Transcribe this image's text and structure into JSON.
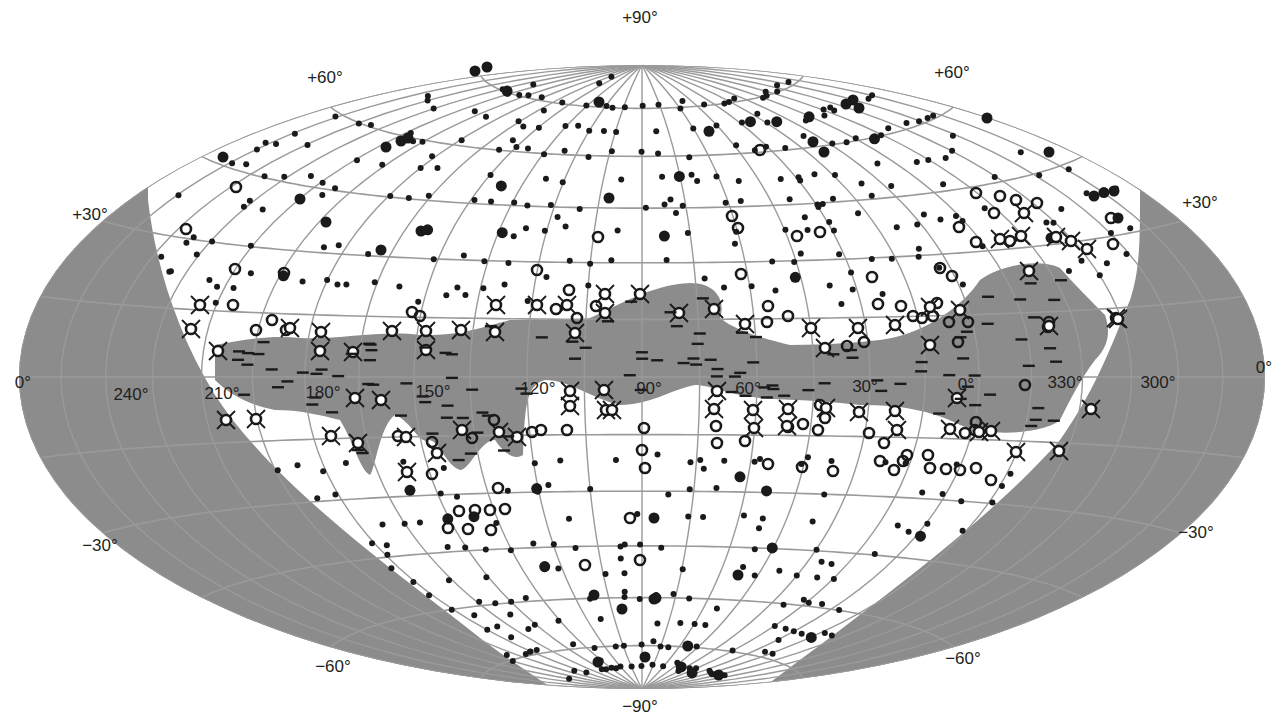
{
  "diagram": {
    "projection": "Aitoff / Hammer equal-area",
    "colors": {
      "background": "#ffffff",
      "sky_fill": "#ffffff",
      "excluded_region": "#8c8c8c",
      "milky_way_band": "#8c8c8c",
      "grid": "#9a9a9a",
      "marker": "#1a1a1a",
      "text": "#231f20"
    },
    "latitude_labels": {
      "top": "+90°",
      "bottom": "−90°",
      "left_p60": "+60°",
      "right_p60": "+60°",
      "left_p30": "+30°",
      "right_p30": "+30°",
      "left_0": "0°",
      "right_0": "0°",
      "left_m30": "−30°",
      "right_m30": "−30°",
      "left_m60": "−60°",
      "right_m60": "−60°"
    },
    "longitude_labels": [
      "240°",
      "210°",
      "180°",
      "150°",
      "120°",
      "90°",
      "60°",
      "30°",
      "0°",
      "330°",
      "300°"
    ],
    "legend_marker_types": [
      {
        "symbol": "small-dot",
        "meaning": "source (small)"
      },
      {
        "symbol": "large-dot",
        "meaning": "source (bright)"
      },
      {
        "symbol": "open-circle",
        "meaning": "source (type 2)"
      },
      {
        "symbol": "crossed-circle",
        "meaning": "source (type 3)"
      },
      {
        "symbol": "dash",
        "meaning": "source in galactic plane band"
      }
    ]
  }
}
